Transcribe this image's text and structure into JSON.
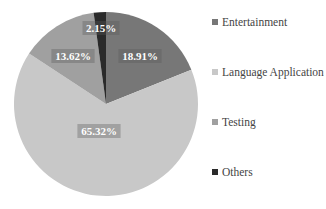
{
  "chart_data": {
    "type": "pie",
    "title": "",
    "categories": [
      "Entertainment",
      "Language Application",
      "Testing",
      "Others"
    ],
    "values": [
      18.91,
      65.32,
      13.62,
      2.15
    ],
    "labels": [
      "18.91%",
      "65.32%",
      "13.62%",
      "2.15%"
    ],
    "colors": [
      "#777777",
      "#c8c8c8",
      "#a0a0a0",
      "#2a2a2a"
    ],
    "legend_position": "right",
    "start_angle_deg": 0,
    "direction": "clockwise"
  },
  "legend": {
    "items": [
      {
        "label": "Entertainment",
        "color": "#777777"
      },
      {
        "label": "Language Application",
        "color": "#c8c8c8"
      },
      {
        "label": "Testing",
        "color": "#a0a0a0"
      },
      {
        "label": "Others",
        "color": "#2a2a2a"
      }
    ]
  }
}
